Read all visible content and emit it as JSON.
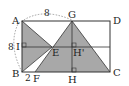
{
  "diagram": {
    "type": "geometry",
    "points": {
      "A": {
        "label": "A",
        "x": 22,
        "y": 21
      },
      "B": {
        "label": "B",
        "x": 22,
        "y": 72
      },
      "C": {
        "label": "C",
        "x": 110,
        "y": 72
      },
      "D": {
        "label": "D",
        "x": 110,
        "y": 21
      },
      "G": {
        "label": "G",
        "x": 72,
        "y": 21
      },
      "H": {
        "label": "H",
        "x": 72,
        "y": 72
      },
      "I": {
        "label": "I",
        "x": 22,
        "y": 47
      },
      "E": {
        "label": "E",
        "x": 52,
        "y": 47
      },
      "Hp": {
        "label": "H'",
        "x": 72,
        "y": 47
      },
      "F": {
        "label": "F",
        "x": 35,
        "y": 72
      }
    },
    "measurements": {
      "AG": "8",
      "AB": "8",
      "BF": "2"
    },
    "colors": {
      "shade": "#a8a8a8",
      "line": "#333333",
      "dashed": "#888888"
    }
  }
}
